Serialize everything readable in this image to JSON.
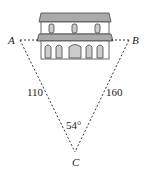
{
  "figure": {
    "points": {
      "A": {
        "label": "A"
      },
      "B": {
        "label": "B"
      },
      "C": {
        "label": "C"
      }
    },
    "sides": {
      "AC": "110",
      "BC": "160"
    },
    "angle_C": "54°",
    "object": "building"
  }
}
